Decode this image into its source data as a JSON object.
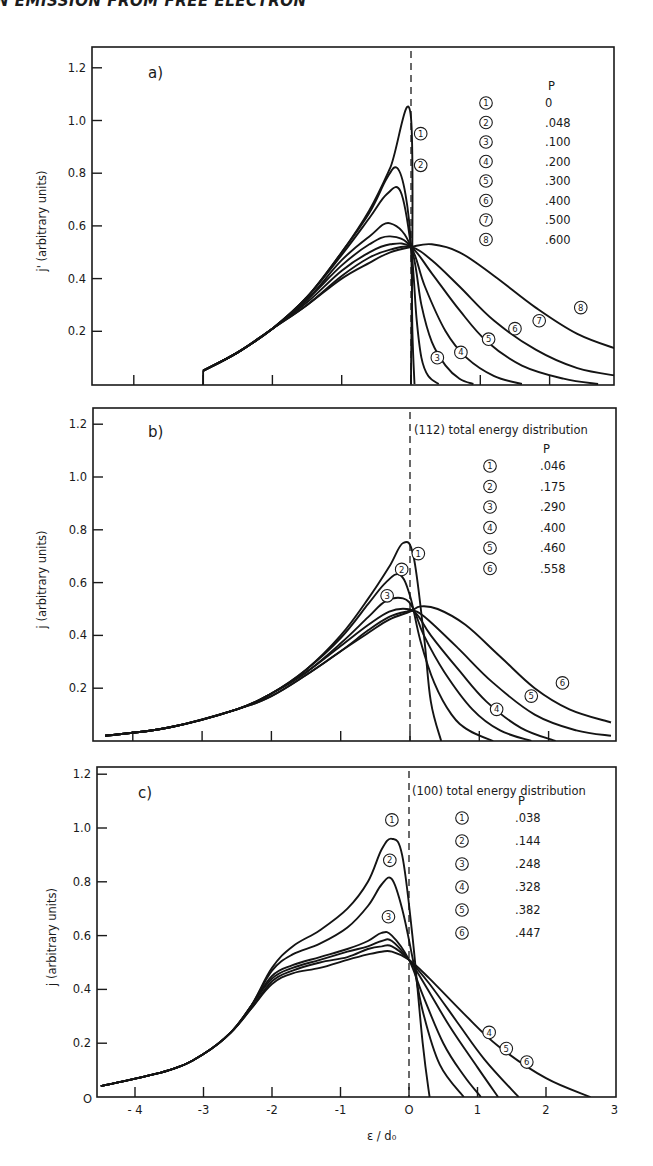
{
  "header": {
    "text": "N EMISSION FROM FREE ELECTRON"
  },
  "chart_data": [
    {
      "id": "a",
      "type": "line",
      "panel_label": "a)",
      "title": "",
      "xlabel": "",
      "ylabel": "j' (arbitrary units)",
      "xlim": [
        -4.6,
        3
      ],
      "ylim": [
        0,
        1.28
      ],
      "yticks": [
        "0.2",
        "0.4",
        "0.6",
        "0.8",
        "1.0",
        "1.2"
      ],
      "xticks": [
        -4,
        -3,
        -2,
        -1,
        0,
        1,
        2
      ],
      "legend_title": "P",
      "legend": [
        {
          "id": "1",
          "p": "0"
        },
        {
          "id": "2",
          "p": ".048"
        },
        {
          "id": "3",
          "p": ".100"
        },
        {
          "id": "4",
          "p": ".200"
        },
        {
          "id": "5",
          "p": ".300"
        },
        {
          "id": "6",
          "p": ".400"
        },
        {
          "id": "7",
          "p": ".500"
        },
        {
          "id": "8",
          "p": ".600"
        }
      ],
      "series": [
        {
          "name": "1",
          "p": 0,
          "x": [
            -3.0,
            -2.5,
            -2.0,
            -1.5,
            -1.0,
            -0.6,
            -0.3,
            0.0,
            0.0
          ],
          "y": [
            0.05,
            0.12,
            0.21,
            0.33,
            0.5,
            0.66,
            0.82,
            1.01,
            0.0
          ]
        },
        {
          "name": "2",
          "p": 0.048,
          "x": [
            -3.0,
            -2.5,
            -2.0,
            -1.5,
            -1.0,
            -0.6,
            -0.35,
            -0.2,
            -0.08,
            0.0,
            0.02,
            0.05
          ],
          "y": [
            0.05,
            0.12,
            0.21,
            0.33,
            0.5,
            0.65,
            0.78,
            0.82,
            0.72,
            0.52,
            0.2,
            0.0
          ]
        },
        {
          "name": "3",
          "p": 0.1,
          "x": [
            -3.0,
            -2.5,
            -2.0,
            -1.5,
            -1.0,
            -0.6,
            -0.35,
            -0.15,
            0.0,
            0.08,
            0.15,
            0.25,
            0.4
          ],
          "y": [
            0.05,
            0.12,
            0.21,
            0.33,
            0.49,
            0.63,
            0.72,
            0.73,
            0.52,
            0.25,
            0.1,
            0.03,
            0.0
          ]
        },
        {
          "name": "4",
          "p": 0.2,
          "x": [
            -3.0,
            -2.5,
            -2.0,
            -1.5,
            -1.0,
            -0.6,
            -0.3,
            0.0,
            0.15,
            0.3,
            0.5,
            0.7,
            0.9
          ],
          "y": [
            0.05,
            0.12,
            0.21,
            0.32,
            0.47,
            0.56,
            0.61,
            0.52,
            0.3,
            0.16,
            0.07,
            0.02,
            0.0
          ]
        },
        {
          "name": "5",
          "p": 0.3,
          "x": [
            -3.0,
            -2.5,
            -2.0,
            -1.5,
            -1.0,
            -0.6,
            -0.3,
            0.0,
            0.2,
            0.5,
            0.8,
            1.2,
            1.6
          ],
          "y": [
            0.05,
            0.12,
            0.21,
            0.32,
            0.45,
            0.53,
            0.56,
            0.52,
            0.37,
            0.2,
            0.1,
            0.03,
            0.0
          ]
        },
        {
          "name": "6",
          "p": 0.4,
          "x": [
            -3.0,
            -2.5,
            -2.0,
            -1.5,
            -1.0,
            -0.6,
            -0.3,
            0.0,
            0.3,
            0.7,
            1.1,
            1.6,
            2.2,
            2.7
          ],
          "y": [
            0.05,
            0.12,
            0.21,
            0.31,
            0.43,
            0.5,
            0.53,
            0.52,
            0.42,
            0.28,
            0.16,
            0.07,
            0.02,
            0.0
          ]
        },
        {
          "name": "7",
          "p": 0.5,
          "x": [
            -3.0,
            -2.5,
            -2.0,
            -1.5,
            -1.0,
            -0.6,
            -0.3,
            0.0,
            0.3,
            0.7,
            1.2,
            1.8,
            2.4,
            3.0
          ],
          "y": [
            0.05,
            0.12,
            0.21,
            0.3,
            0.41,
            0.48,
            0.51,
            0.52,
            0.47,
            0.37,
            0.24,
            0.13,
            0.06,
            0.03
          ]
        },
        {
          "name": "8",
          "p": 0.6,
          "x": [
            -3.0,
            -2.5,
            -2.0,
            -1.5,
            -1.0,
            -0.6,
            -0.3,
            0.0,
            0.3,
            0.7,
            1.2,
            1.8,
            2.4,
            3.0
          ],
          "y": [
            0.05,
            0.12,
            0.21,
            0.3,
            0.4,
            0.46,
            0.5,
            0.52,
            0.53,
            0.5,
            0.41,
            0.29,
            0.19,
            0.13
          ]
        }
      ],
      "annotations": [
        {
          "text": "1",
          "x": 0.14,
          "y": 0.95
        },
        {
          "text": "2",
          "x": 0.14,
          "y": 0.83
        },
        {
          "text": "3",
          "x": 0.38,
          "y": 0.1
        },
        {
          "text": "4",
          "x": 0.72,
          "y": 0.12
        },
        {
          "text": "5",
          "x": 1.12,
          "y": 0.17
        },
        {
          "text": "6",
          "x": 1.5,
          "y": 0.21
        },
        {
          "text": "7",
          "x": 1.85,
          "y": 0.24
        },
        {
          "text": "8",
          "x": 2.45,
          "y": 0.29
        }
      ]
    },
    {
      "id": "b",
      "type": "line",
      "panel_label": "b)",
      "title": "(112) total energy distribution",
      "xlabel": "",
      "ylabel": "j (arbitrary units)",
      "xlim": [
        -4.6,
        3
      ],
      "ylim": [
        0,
        1.28
      ],
      "yticks": [
        "0.2",
        "0.4",
        "0.6",
        "0.8",
        "1.0",
        "1.2"
      ],
      "xticks": [
        -4,
        -3,
        -2,
        -1,
        0,
        1,
        2
      ],
      "legend_title": "P",
      "legend": [
        {
          "id": "1",
          "p": ".046"
        },
        {
          "id": "2",
          "p": ".175"
        },
        {
          "id": "3",
          "p": ".290"
        },
        {
          "id": "4",
          "p": ".400"
        },
        {
          "id": "5",
          "p": ".460"
        },
        {
          "id": "6",
          "p": ".558"
        }
      ],
      "series": [
        {
          "name": "1",
          "p": 0.046,
          "x": [
            -4.4,
            -3.5,
            -2.5,
            -2.0,
            -1.5,
            -1.0,
            -0.6,
            -0.3,
            -0.1,
            0.05,
            0.2,
            0.3,
            0.45
          ],
          "y": [
            0.02,
            0.05,
            0.12,
            0.18,
            0.27,
            0.4,
            0.54,
            0.66,
            0.75,
            0.7,
            0.4,
            0.15,
            0.0
          ]
        },
        {
          "name": "2",
          "p": 0.175,
          "x": [
            -4.4,
            -3.5,
            -2.5,
            -2.0,
            -1.5,
            -1.0,
            -0.6,
            -0.35,
            -0.15,
            0.0,
            0.15,
            0.35,
            0.6,
            0.85,
            1.2
          ],
          "y": [
            0.02,
            0.05,
            0.12,
            0.18,
            0.27,
            0.39,
            0.52,
            0.6,
            0.63,
            0.55,
            0.38,
            0.22,
            0.1,
            0.04,
            0.0
          ]
        },
        {
          "name": "3",
          "p": 0.29,
          "x": [
            -4.4,
            -3.5,
            -2.5,
            -2.0,
            -1.5,
            -1.0,
            -0.6,
            -0.35,
            -0.1,
            0.05,
            0.2,
            0.5,
            0.9,
            1.3,
            1.75
          ],
          "y": [
            0.02,
            0.05,
            0.12,
            0.18,
            0.26,
            0.37,
            0.47,
            0.53,
            0.54,
            0.5,
            0.4,
            0.26,
            0.12,
            0.04,
            0.0
          ]
        },
        {
          "name": "4",
          "p": 0.4,
          "x": [
            -4.4,
            -3.5,
            -2.5,
            -2.0,
            -1.5,
            -1.0,
            -0.6,
            -0.3,
            -0.05,
            0.1,
            0.3,
            0.7,
            1.1,
            1.6,
            2.1
          ],
          "y": [
            0.02,
            0.05,
            0.12,
            0.18,
            0.26,
            0.36,
            0.44,
            0.49,
            0.5,
            0.48,
            0.4,
            0.27,
            0.15,
            0.05,
            0.0
          ]
        },
        {
          "name": "5",
          "p": 0.46,
          "x": [
            -4.4,
            -3.5,
            -2.5,
            -2.0,
            -1.5,
            -1.0,
            -0.6,
            -0.3,
            -0.05,
            0.1,
            0.3,
            0.7,
            1.2,
            1.8,
            2.4,
            2.9
          ],
          "y": [
            0.02,
            0.05,
            0.12,
            0.17,
            0.25,
            0.34,
            0.42,
            0.47,
            0.49,
            0.49,
            0.45,
            0.35,
            0.22,
            0.1,
            0.04,
            0.02
          ]
        },
        {
          "name": "6",
          "p": 0.558,
          "x": [
            -4.4,
            -3.5,
            -2.5,
            -2.0,
            -1.5,
            -1.0,
            -0.6,
            -0.3,
            0.0,
            0.15,
            0.4,
            0.8,
            1.3,
            1.8,
            2.3,
            2.9
          ],
          "y": [
            0.02,
            0.05,
            0.12,
            0.17,
            0.25,
            0.34,
            0.41,
            0.46,
            0.49,
            0.51,
            0.5,
            0.44,
            0.32,
            0.2,
            0.12,
            0.07
          ]
        }
      ],
      "annotations": [
        {
          "text": "1",
          "x": 0.12,
          "y": 0.71
        },
        {
          "text": "2",
          "x": -0.12,
          "y": 0.65
        },
        {
          "text": "3",
          "x": -0.33,
          "y": 0.55
        },
        {
          "text": "4",
          "x": 1.25,
          "y": 0.12
        },
        {
          "text": "5",
          "x": 1.75,
          "y": 0.17
        },
        {
          "text": "6",
          "x": 2.2,
          "y": 0.22
        }
      ]
    },
    {
      "id": "c",
      "type": "line",
      "panel_label": "c)",
      "title": "(100) total energy distribution",
      "xlabel": "ε / d₀",
      "ylabel": "j (arbitrary units)",
      "xlim": [
        -4.5,
        3
      ],
      "ylim": [
        0,
        1.28
      ],
      "yticks": [
        "0.2",
        "0.4",
        "0.6",
        "0.8",
        "1.0",
        "1.2"
      ],
      "origin_label": "O",
      "xticks": [
        -4,
        -3,
        -2,
        -1,
        0,
        1,
        2,
        3
      ],
      "xtick_labels": [
        "- 4",
        "-3",
        "-2",
        "-1",
        "O",
        "1",
        "2",
        "3"
      ],
      "legend_title": "P",
      "legend": [
        {
          "id": "1",
          "p": ".038"
        },
        {
          "id": "2",
          "p": ".144"
        },
        {
          "id": "3",
          "p": ".248"
        },
        {
          "id": "4",
          "p": ".328"
        },
        {
          "id": "5",
          "p": ".382"
        },
        {
          "id": "6",
          "p": ".447"
        }
      ],
      "series": [
        {
          "name": "1",
          "p": 0.038,
          "x": [
            -4.5,
            -3.5,
            -3.0,
            -2.6,
            -2.3,
            -2.0,
            -1.7,
            -1.3,
            -0.9,
            -0.6,
            -0.4,
            -0.25,
            -0.1,
            0.05,
            0.2,
            0.3
          ],
          "y": [
            0.04,
            0.1,
            0.16,
            0.24,
            0.34,
            0.48,
            0.56,
            0.62,
            0.7,
            0.8,
            0.92,
            0.96,
            0.9,
            0.6,
            0.2,
            0.0
          ]
        },
        {
          "name": "2",
          "p": 0.144,
          "x": [
            -4.5,
            -3.5,
            -3.0,
            -2.6,
            -2.3,
            -2.0,
            -1.7,
            -1.3,
            -0.9,
            -0.6,
            -0.4,
            -0.25,
            -0.1,
            0.05,
            0.2,
            0.45,
            0.8
          ],
          "y": [
            0.04,
            0.1,
            0.16,
            0.24,
            0.34,
            0.47,
            0.53,
            0.57,
            0.63,
            0.71,
            0.79,
            0.81,
            0.7,
            0.52,
            0.32,
            0.12,
            0.0
          ]
        },
        {
          "name": "3",
          "p": 0.248,
          "x": [
            -4.5,
            -3.5,
            -3.0,
            -2.6,
            -2.3,
            -2.0,
            -1.7,
            -1.3,
            -0.9,
            -0.6,
            -0.4,
            -0.25,
            0.0,
            0.2,
            0.5,
            0.8,
            1.05
          ],
          "y": [
            0.04,
            0.1,
            0.16,
            0.24,
            0.34,
            0.45,
            0.49,
            0.52,
            0.55,
            0.58,
            0.61,
            0.6,
            0.51,
            0.38,
            0.2,
            0.08,
            0.0
          ]
        },
        {
          "name": "4",
          "p": 0.328,
          "x": [
            -4.5,
            -3.5,
            -3.0,
            -2.6,
            -2.3,
            -2.0,
            -1.7,
            -1.3,
            -0.9,
            -0.6,
            -0.4,
            -0.25,
            0.0,
            0.25,
            0.6,
            1.0,
            1.3
          ],
          "y": [
            0.04,
            0.1,
            0.16,
            0.24,
            0.34,
            0.44,
            0.48,
            0.51,
            0.54,
            0.56,
            0.58,
            0.58,
            0.51,
            0.41,
            0.26,
            0.11,
            0.0
          ]
        },
        {
          "name": "5",
          "p": 0.382,
          "x": [
            -4.5,
            -3.5,
            -3.0,
            -2.6,
            -2.3,
            -2.0,
            -1.7,
            -1.3,
            -0.9,
            -0.6,
            -0.4,
            -0.25,
            0.0,
            0.3,
            0.7,
            1.1,
            1.6
          ],
          "y": [
            0.04,
            0.1,
            0.16,
            0.24,
            0.33,
            0.43,
            0.47,
            0.5,
            0.52,
            0.55,
            0.56,
            0.56,
            0.51,
            0.42,
            0.28,
            0.14,
            0.0
          ]
        },
        {
          "name": "6",
          "p": 0.447,
          "x": [
            -4.5,
            -3.5,
            -3.0,
            -2.6,
            -2.3,
            -2.0,
            -1.7,
            -1.3,
            -0.9,
            -0.6,
            -0.4,
            -0.25,
            0.0,
            0.3,
            0.8,
            1.3,
            2.0,
            2.65
          ],
          "y": [
            0.04,
            0.1,
            0.16,
            0.24,
            0.33,
            0.42,
            0.46,
            0.48,
            0.51,
            0.53,
            0.54,
            0.54,
            0.51,
            0.44,
            0.31,
            0.19,
            0.07,
            0.0
          ]
        }
      ],
      "annotations": [
        {
          "text": "1",
          "x": -0.25,
          "y": 1.03
        },
        {
          "text": "2",
          "x": -0.28,
          "y": 0.88
        },
        {
          "text": "3",
          "x": -0.3,
          "y": 0.67
        },
        {
          "text": "4",
          "x": 1.17,
          "y": 0.24
        },
        {
          "text": "5",
          "x": 1.42,
          "y": 0.18
        },
        {
          "text": "6",
          "x": 1.72,
          "y": 0.13
        }
      ]
    }
  ]
}
